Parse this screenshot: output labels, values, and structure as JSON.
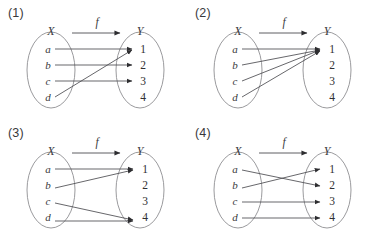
{
  "figure": {
    "background_color": "#ffffff",
    "line_color": "#4c4c50",
    "oval_color": "#8e8e92",
    "text_color": "#3a3a3d",
    "domain_label": "X",
    "codomain_label": "Y",
    "function_label": "f",
    "domain_elements": [
      "a",
      "b",
      "c",
      "d"
    ],
    "codomain_elements": [
      "1",
      "2",
      "3",
      "4"
    ]
  },
  "panels": [
    {
      "label": "(1)",
      "domain_label": "X",
      "codomain_label": "Y",
      "function_label": "f",
      "domain_elements": [
        "a",
        "b",
        "c",
        "d"
      ],
      "codomain_elements": [
        "1",
        "2",
        "3",
        "4"
      ],
      "mappings": [
        {
          "from": "a",
          "to": "1"
        },
        {
          "from": "b",
          "to": "2"
        },
        {
          "from": "c",
          "to": "3"
        },
        {
          "from": "d",
          "to": "1"
        }
      ],
      "unmapped_targets": [
        "4"
      ]
    },
    {
      "label": "(2)",
      "domain_label": "X",
      "codomain_label": "Y",
      "function_label": "f",
      "domain_elements": [
        "a",
        "b",
        "c",
        "d"
      ],
      "codomain_elements": [
        "1",
        "2",
        "3",
        "4"
      ],
      "mappings": [
        {
          "from": "a",
          "to": "1"
        },
        {
          "from": "b",
          "to": "1"
        },
        {
          "from": "c",
          "to": "1"
        },
        {
          "from": "d",
          "to": "1"
        }
      ],
      "unmapped_targets": [
        "2",
        "3",
        "4"
      ]
    },
    {
      "label": "(3)",
      "domain_label": "X",
      "codomain_label": "Y",
      "function_label": "f",
      "domain_elements": [
        "a",
        "b",
        "c",
        "d"
      ],
      "codomain_elements": [
        "1",
        "2",
        "3",
        "4"
      ],
      "mappings": [
        {
          "from": "a",
          "to": "1"
        },
        {
          "from": "b",
          "to": "1"
        },
        {
          "from": "c",
          "to": "4"
        },
        {
          "from": "d",
          "to": "4"
        }
      ],
      "unmapped_targets": [
        "2",
        "3"
      ]
    },
    {
      "label": "(4)",
      "domain_label": "X",
      "codomain_label": "Y",
      "function_label": "f",
      "domain_elements": [
        "a",
        "b",
        "c",
        "d"
      ],
      "codomain_elements": [
        "1",
        "2",
        "3",
        "4"
      ],
      "mappings": [
        {
          "from": "a",
          "to": "2"
        },
        {
          "from": "b",
          "to": "1"
        },
        {
          "from": "c",
          "to": "3"
        },
        {
          "from": "d",
          "to": "4"
        }
      ],
      "unmapped_targets": []
    }
  ]
}
